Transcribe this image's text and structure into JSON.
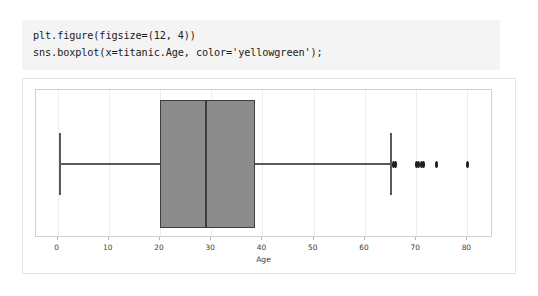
{
  "notebook": {
    "code_cell": {
      "lines": [
        "plt.figure(figsize=(12, 4))",
        "sns.boxplot(x=titanic.Age, color='yellowgreen');"
      ],
      "line1": "plt.figure(figsize=(12, 4))",
      "line2": "sns.boxplot(x=titanic.Age, color='yellowgreen');"
    }
  },
  "colors": {
    "code_background": "#f4f4f4",
    "box_fill": "#8c8c8c",
    "box_edge": "#3f3f3f",
    "whisker": "#5a5a5a",
    "outlier": "#1f1f1f",
    "grid": "#ededed",
    "axes_border": "#d0d0d0",
    "output_border": "#e3e3e3"
  },
  "chart_data": {
    "type": "box",
    "title": "",
    "xlabel": "Age",
    "ylabel": "",
    "xlim": [
      -4.2,
      85.0
    ],
    "xticks": [
      0,
      10,
      20,
      30,
      40,
      50,
      60,
      70,
      80
    ],
    "xticklabels": [
      "0",
      "10",
      "20",
      "30",
      "40",
      "50",
      "60",
      "70",
      "80"
    ],
    "grid": true,
    "legend": false,
    "orientation": "horizontal",
    "series": [
      {
        "name": "Age",
        "whisker_low": 0.42,
        "q1": 20.0,
        "median": 29.0,
        "q3": 38.5,
        "whisker_high": 65.0,
        "outliers": [
          65.5,
          66.0,
          70.0,
          70.5,
          71.0,
          71.5,
          74.0,
          80.0
        ]
      }
    ]
  }
}
